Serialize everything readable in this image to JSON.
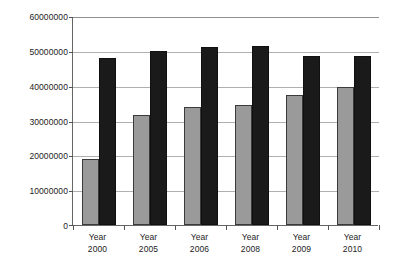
{
  "chart_data": {
    "type": "bar",
    "title": "",
    "subtitle": "",
    "xlabel": "",
    "ylabel": "",
    "categories": [
      "Year 2000",
      "Year 2005",
      "Year 2006",
      "Year 2008",
      "Year 2009",
      "Year 2010"
    ],
    "category_lines": [
      [
        "Year",
        "2000"
      ],
      [
        "Year",
        "2005"
      ],
      [
        "Year",
        "2006"
      ],
      [
        "Year",
        "2008"
      ],
      [
        "Year",
        "2009"
      ],
      [
        "Year",
        "2010"
      ]
    ],
    "series": [
      {
        "name": "Series 1",
        "color": "#9a9a9a",
        "values": [
          19000000,
          31800000,
          34200000,
          34800000,
          37600000,
          39800000
        ]
      },
      {
        "name": "Series 2",
        "color": "#1a1a1a",
        "values": [
          48200000,
          50200000,
          51600000,
          51800000,
          48800000,
          49000000
        ]
      }
    ],
    "ylim": [
      0,
      60000000
    ],
    "y_ticks": [
      0,
      10000000,
      20000000,
      30000000,
      40000000,
      50000000,
      60000000
    ],
    "y_tick_labels": [
      "0",
      "10000000",
      "20000000",
      "30000000",
      "40000000",
      "50000000",
      "60000000"
    ],
    "grid": true,
    "grid_axis": "y",
    "legend": false,
    "legend_position": "none",
    "annotations": []
  },
  "axis": {
    "y_label_0": "0",
    "y_label_1": "10000000",
    "y_label_2": "20000000",
    "y_label_3": "30000000",
    "y_label_4": "40000000",
    "y_label_5": "50000000",
    "y_label_6": "60000000"
  }
}
